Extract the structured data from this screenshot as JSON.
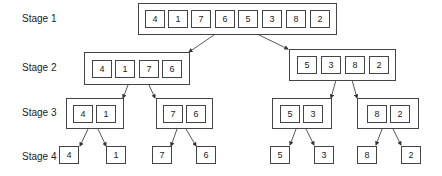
{
  "stages": [
    {
      "label": "Stage 1"
    },
    {
      "label": "Stage 2"
    },
    {
      "label": "Stage 3"
    },
    {
      "label": "Stage 4"
    }
  ],
  "stage1": {
    "values": [
      "4",
      "1",
      "7",
      "6",
      "5",
      "3",
      "8",
      "2"
    ]
  },
  "stage2": {
    "left": {
      "values": [
        "4",
        "1",
        "7",
        "6"
      ]
    },
    "right": {
      "values": [
        "5",
        "3",
        "8",
        "2"
      ]
    }
  },
  "stage3": {
    "g1": {
      "values": [
        "4",
        "1"
      ]
    },
    "g2": {
      "values": [
        "7",
        "6"
      ]
    },
    "g3": {
      "values": [
        "5",
        "3"
      ]
    },
    "g4": {
      "values": [
        "8",
        "2"
      ]
    }
  },
  "stage4": {
    "values": [
      "4",
      "1",
      "7",
      "6",
      "5",
      "3",
      "8",
      "2"
    ]
  },
  "colors": {
    "stroke": "#444444",
    "text": "#222222",
    "background": "#ffffff"
  }
}
